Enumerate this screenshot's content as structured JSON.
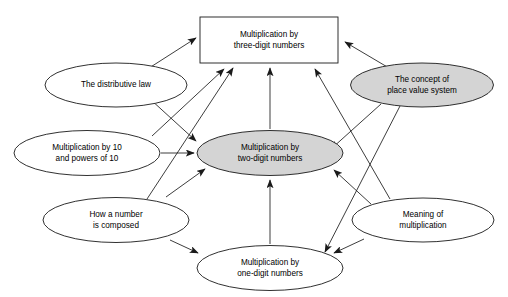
{
  "diagram": {
    "background_color": "#ffffff",
    "stroke_color": "#1a1a1a",
    "shaded_fill": "#d4d4d4",
    "plain_fill": "#ffffff",
    "nodes": [
      {
        "id": "three-digit",
        "shape": "rectangle",
        "shaded": false,
        "lines": [
          "Multiplication by",
          "three-digit numbers"
        ],
        "cx": 269,
        "cy": 40,
        "w": 138,
        "h": 46
      },
      {
        "id": "distributive-law",
        "shape": "ellipse",
        "shaded": false,
        "lines": [
          "The distributive law"
        ],
        "cx": 116,
        "cy": 85,
        "w": 142,
        "h": 44
      },
      {
        "id": "place-value",
        "shape": "ellipse",
        "shaded": true,
        "lines": [
          "The concept of",
          "place value system"
        ],
        "cx": 422,
        "cy": 85,
        "w": 143,
        "h": 44
      },
      {
        "id": "powers-of-ten",
        "shape": "ellipse",
        "shaded": false,
        "lines": [
          "Multiplication by 10",
          "and powers of 10"
        ],
        "cx": 87,
        "cy": 153,
        "w": 146,
        "h": 45
      },
      {
        "id": "two-digit",
        "shape": "ellipse",
        "shaded": true,
        "lines": [
          "Multiplication by",
          "two-digit numbers"
        ],
        "cx": 270,
        "cy": 153,
        "w": 146,
        "h": 45
      },
      {
        "id": "how-composed",
        "shape": "ellipse",
        "shaded": false,
        "lines": [
          "How a number",
          "is composed"
        ],
        "cx": 116,
        "cy": 220,
        "w": 146,
        "h": 45
      },
      {
        "id": "meaning",
        "shape": "ellipse",
        "shaded": false,
        "lines": [
          "Meaning of",
          "multiplication"
        ],
        "cx": 423,
        "cy": 220,
        "w": 142,
        "h": 44
      },
      {
        "id": "one-digit",
        "shape": "ellipse",
        "shaded": false,
        "lines": [
          "Multiplication by",
          "one-digit numbers"
        ],
        "cx": 270,
        "cy": 268,
        "w": 146,
        "h": 45
      }
    ],
    "edges": [
      {
        "from": "distributive-law",
        "to": "three-digit",
        "arrow": "single",
        "x1": 146,
        "y1": 70,
        "x2": 196,
        "y2": 38
      },
      {
        "from": "place-value",
        "to": "three-digit",
        "arrow": "single",
        "x1": 389,
        "y1": 68,
        "x2": 345,
        "y2": 42
      },
      {
        "from": "distributive-law",
        "to": "two-digit",
        "arrow": "single",
        "x1": 150,
        "y1": 99,
        "x2": 196,
        "y2": 141
      },
      {
        "from": "powers-of-ten",
        "to": "three-digit",
        "arrow": "single",
        "x1": 152,
        "y1": 136,
        "x2": 224,
        "y2": 69
      },
      {
        "from": "powers-of-ten",
        "to": "two-digit",
        "arrow": "single",
        "x1": 161,
        "y1": 153,
        "x2": 194,
        "y2": 153
      },
      {
        "from": "how-composed",
        "to": "three-digit",
        "arrow": "single",
        "x1": 147,
        "y1": 199,
        "x2": 233,
        "y2": 68
      },
      {
        "from": "how-composed",
        "to": "two-digit",
        "arrow": "single",
        "x1": 166,
        "y1": 197,
        "x2": 205,
        "y2": 169
      },
      {
        "from": "how-composed",
        "to": "one-digit",
        "arrow": "single",
        "x1": 170,
        "y1": 240,
        "x2": 198,
        "y2": 253
      },
      {
        "from": "place-value",
        "to": "two-digit",
        "arrow": "single",
        "x1": 381,
        "y1": 104,
        "x2": 331,
        "y2": 149
      },
      {
        "from": "place-value",
        "to": "one-digit",
        "arrow": "single",
        "x1": 400,
        "y1": 106,
        "x2": 325,
        "y2": 252
      },
      {
        "from": "meaning",
        "to": "three-digit",
        "arrow": "single",
        "x1": 390,
        "y1": 199,
        "x2": 315,
        "y2": 69
      },
      {
        "from": "meaning",
        "to": "two-digit",
        "arrow": "single",
        "x1": 371,
        "y1": 204,
        "x2": 334,
        "y2": 170
      },
      {
        "from": "meaning",
        "to": "one-digit",
        "arrow": "single",
        "x1": 364,
        "y1": 239,
        "x2": 334,
        "y2": 253
      },
      {
        "from": "one-digit",
        "to": "two-digit",
        "arrow": "single",
        "x1": 270,
        "y1": 244,
        "x2": 270,
        "y2": 180
      },
      {
        "from": "two-digit",
        "to": "three-digit",
        "arrow": "single",
        "x1": 270,
        "y1": 129,
        "x2": 270,
        "y2": 68
      }
    ]
  }
}
